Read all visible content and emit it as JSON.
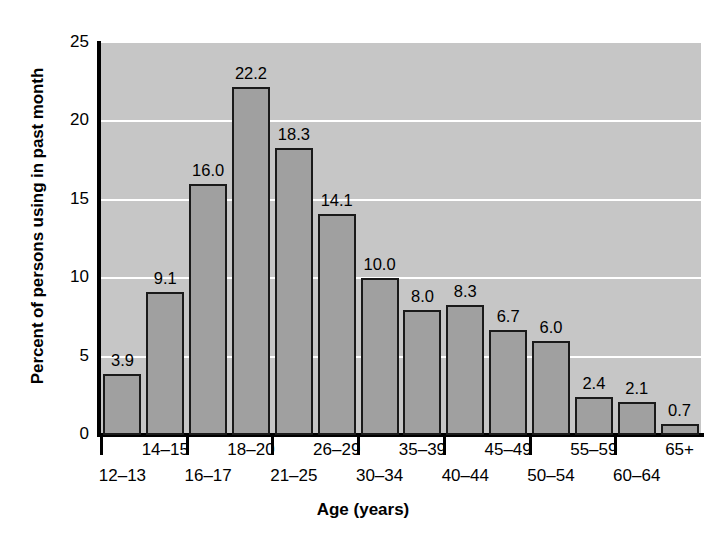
{
  "chart_data": {
    "type": "bar",
    "title": "",
    "xlabel": "Age (years)",
    "ylabel": "Percent of persons using in past month",
    "categories": [
      "12–13",
      "14–15",
      "16–17",
      "18–20",
      "21–25",
      "26–29",
      "30–34",
      "35–39",
      "40–44",
      "45–49",
      "50–54",
      "55–59",
      "60–64",
      "65+"
    ],
    "values": [
      3.9,
      9.1,
      16.0,
      22.2,
      18.3,
      14.1,
      10.0,
      8.0,
      8.3,
      6.7,
      6.0,
      2.4,
      2.1,
      0.7
    ],
    "value_labels": [
      "3.9",
      "9.1",
      "16.0",
      "22.2",
      "18.3",
      "14.1",
      "10.0",
      "8.0",
      "8.3",
      "6.7",
      "6.0",
      "2.4",
      "2.1",
      "0.7"
    ],
    "ylim": [
      0,
      25
    ],
    "yticks": [
      0,
      5,
      10,
      15,
      20,
      25
    ],
    "ytick_labels": [
      "0",
      "5",
      "10",
      "15",
      "20",
      "25"
    ],
    "gridlines": [
      5,
      10,
      15,
      20
    ],
    "grid": true,
    "legend": "none",
    "colors": {
      "bar_fill": "#a0a0a0",
      "bar_edge": "#1a1a1a",
      "plot_background": "#c6c6c6",
      "gridline": "#ffffff",
      "axis": "#000000",
      "text": "#000000",
      "page_background": "#ffffff"
    }
  }
}
